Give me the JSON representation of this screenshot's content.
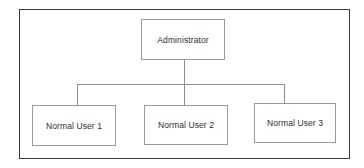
{
  "diagram": {
    "type": "hierarchy",
    "root": {
      "label": "Administrator"
    },
    "children": [
      {
        "label": "Normal User 1"
      },
      {
        "label": "Normal User 2"
      },
      {
        "label": "Normal User 3"
      }
    ]
  },
  "colors": {
    "frame_border": "#3a3a3a",
    "node_border": "#9a9a9a",
    "connector": "#8f8f8f",
    "text": "#2e2e2e",
    "background": "#ffffff"
  }
}
